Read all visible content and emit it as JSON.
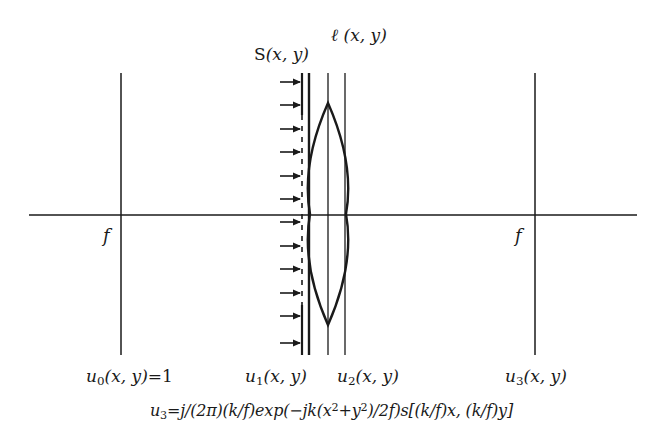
{
  "diagram": {
    "colors": {
      "stroke": "#1a1a1a",
      "background": "#ffffff"
    },
    "axis": {
      "x1": 29,
      "x2": 637,
      "y": 215
    },
    "planes": [
      {
        "id": "u0",
        "x": 121,
        "y1": 73,
        "y2": 355,
        "width": 1.5,
        "style": "solid"
      },
      {
        "id": "s-front",
        "x": 302,
        "y1": 73,
        "y2": 355,
        "width": 2.2,
        "style": "solid-dashed-solid",
        "dash_from": 115,
        "dash_to": 305
      },
      {
        "id": "lens-front",
        "x": 309,
        "y1": 73,
        "y2": 355,
        "width": 2.4,
        "style": "solid"
      },
      {
        "id": "lens-center",
        "x": 328,
        "y1": 73,
        "y2": 355,
        "width": 1.3,
        "style": "solid"
      },
      {
        "id": "u2",
        "x": 345,
        "y1": 73,
        "y2": 355,
        "width": 1.3,
        "style": "solid"
      },
      {
        "id": "u3",
        "x": 535,
        "y1": 73,
        "y2": 355,
        "width": 1.5,
        "style": "solid"
      }
    ],
    "lens": {
      "cx": 328,
      "top_y": 103,
      "bottom_y": 325,
      "half_width": 18
    },
    "arrows": {
      "x_start": 280,
      "x_end": 300,
      "y": [
        82,
        105,
        129,
        152,
        176,
        199,
        222,
        246,
        269,
        293,
        316,
        343
      ]
    },
    "labels": {
      "S": {
        "name": "S",
        "args": "(x, y)"
      },
      "ell": {
        "name": "ℓ",
        "args": "(x, y)"
      },
      "f_left": "f",
      "f_right": "f",
      "u0": {
        "base": "u",
        "sub": "0",
        "args": "(x, y)",
        "suffix": "=1"
      },
      "u1": {
        "base": "u",
        "sub": "1",
        "args": "(x, y)"
      },
      "u2": {
        "base": "u",
        "sub": "2",
        "args": "(x, y)"
      },
      "u3": {
        "base": "u",
        "sub": "3",
        "args": "(x, y)"
      }
    },
    "formula": {
      "lhs_base": "u",
      "lhs_sub": "3",
      "part1": "=j/(2π)(k/f)exp(−jk(x",
      "sup1": "2",
      "part2": "+y",
      "sup2": "2",
      "part3": ")/2f)s[(k/f)x, (k/f)y]"
    }
  }
}
